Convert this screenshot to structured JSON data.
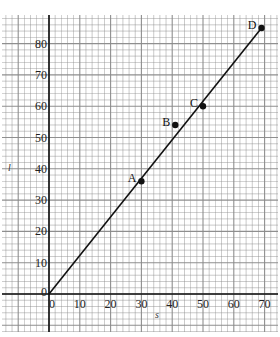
{
  "chart_data": {
    "type": "line",
    "title": "",
    "xlabel": "s",
    "ylabel": "l",
    "xlim": [
      0,
      70
    ],
    "ylim": [
      0,
      85
    ],
    "x_ticks": [
      0,
      10,
      20,
      30,
      40,
      50,
      60,
      70
    ],
    "y_ticks": [
      0,
      10,
      20,
      30,
      40,
      50,
      60,
      70,
      80
    ],
    "x_tick_labels": [
      "0",
      "10",
      "20",
      "30",
      "40",
      "50",
      "60",
      "70"
    ],
    "y_tick_labels": [
      "0",
      "10",
      "20",
      "30",
      "40",
      "50",
      "60",
      "70",
      "80"
    ],
    "grid": true,
    "grid_minor_step": 2,
    "points": [
      {
        "label": "A",
        "x": 30,
        "y": 36
      },
      {
        "label": "B",
        "x": 41,
        "y": 54
      },
      {
        "label": "C",
        "x": 50,
        "y": 60
      },
      {
        "label": "D",
        "x": 69,
        "y": 85
      }
    ],
    "series": [
      {
        "name": "best-fit line",
        "x": [
          0,
          69
        ],
        "y": [
          0,
          85
        ]
      }
    ]
  },
  "colors": {
    "grid": "#8a8a8a",
    "axis": "#111111",
    "line": "#111111",
    "background": "#ffffff"
  }
}
